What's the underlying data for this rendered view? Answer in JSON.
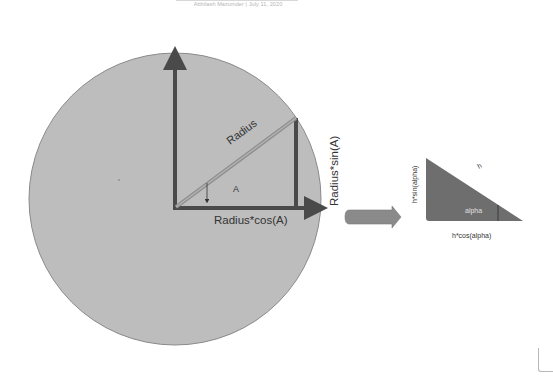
{
  "header": {
    "author": "Abhilash Mazumder",
    "separator": "|",
    "date": "July 11, 2020",
    "byline": "Abhilash Mazumder  |  July 11, 2020"
  },
  "diagram": {
    "circle_labels": {
      "radius": "Radius",
      "angle": "A",
      "adjacent": "Radius*cos(A)",
      "opposite": "Radius*sin(A)"
    },
    "triangle_labels": {
      "hypotenuse": "h",
      "angle": "alpha",
      "adjacent": "h*cos(alpha)",
      "opposite": "h*sin(alpha)"
    },
    "colors": {
      "circle_fill": "#bdbdbd",
      "circle_stroke": "#8a8a8a",
      "axis_dark": "#4a4a4a",
      "radius_line": "#9c9c9c",
      "triangle_fill": "#6e6e6e",
      "block_arrow": "#8a8a8a"
    }
  }
}
